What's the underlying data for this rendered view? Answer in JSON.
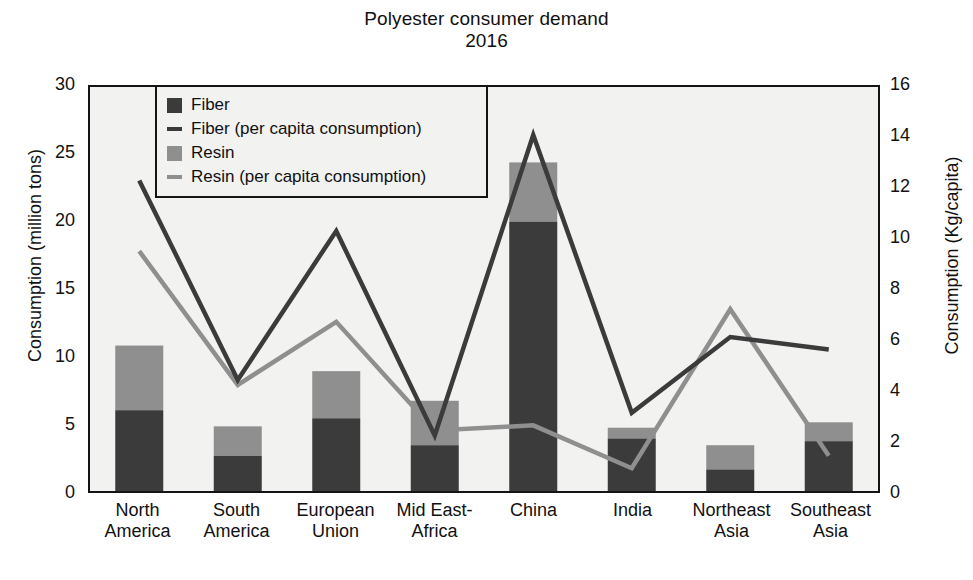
{
  "chart_data": {
    "type": "bar",
    "title": "Polyester consumer demand",
    "subtitle": "2016",
    "categories": [
      "North America",
      "South America",
      "European Union",
      "Mid East-Africa",
      "China",
      "India",
      "Northeast Asia",
      "Southeast Asia"
    ],
    "category_lines": [
      [
        "North",
        "America"
      ],
      [
        "South",
        "America"
      ],
      [
        "European",
        "Union"
      ],
      [
        "Mid East-",
        "Africa"
      ],
      [
        "China",
        ""
      ],
      [
        "India",
        ""
      ],
      [
        "Northeast",
        "Asia"
      ],
      [
        "Southeast",
        "Asia"
      ]
    ],
    "xlabel": "",
    "ylabel": "Consumption (million tons)",
    "y2label": "Consumption (Kg/capita)",
    "ylim": [
      0,
      30
    ],
    "y2lim": [
      0,
      16
    ],
    "yticks": [
      0,
      5,
      10,
      15,
      20,
      25,
      30
    ],
    "y2ticks": [
      0,
      2,
      4,
      6,
      8,
      10,
      12,
      14,
      16
    ],
    "grid": false,
    "legend_position": "upper left",
    "stacked": true,
    "series": [
      {
        "name": "Fiber",
        "kind": "bar",
        "axis": "left",
        "color": "#3b3b3b",
        "values": [
          6.0,
          2.6,
          5.4,
          3.4,
          20.0,
          3.9,
          1.6,
          3.7
        ]
      },
      {
        "name": "Resin",
        "kind": "bar",
        "axis": "left",
        "color": "#8f8f8f",
        "values": [
          4.8,
          2.2,
          3.5,
          3.3,
          4.4,
          0.8,
          1.8,
          1.4
        ]
      },
      {
        "name": "Fiber (per capita consumption)",
        "kind": "line",
        "axis": "right",
        "color": "#3b3b3b",
        "values": [
          12.3,
          4.4,
          10.3,
          2.2,
          14.1,
          3.1,
          6.1,
          5.6
        ]
      },
      {
        "name": "Resin (per capita consumption)",
        "kind": "line",
        "axis": "right",
        "color": "#8f8f8f",
        "values": [
          9.5,
          4.2,
          6.7,
          2.4,
          2.6,
          0.9,
          7.2,
          1.4
        ]
      }
    ],
    "totals": [
      10.8,
      4.8,
      8.9,
      6.7,
      24.4,
      4.7,
      3.4,
      5.1
    ]
  },
  "legend": {
    "items": [
      {
        "label": "Fiber",
        "marker": "square-dark"
      },
      {
        "label": "Fiber (per capita consumption)",
        "marker": "line-dark"
      },
      {
        "label": "Resin",
        "marker": "square-light"
      },
      {
        "label": "Resin (per capita consumption)",
        "marker": "line-light"
      }
    ]
  }
}
